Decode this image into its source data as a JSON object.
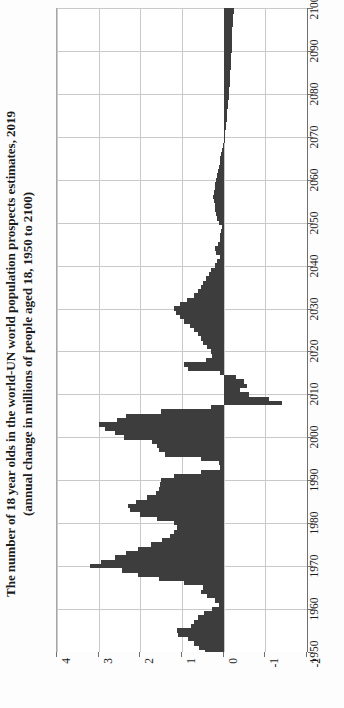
{
  "title": {
    "line1": "The number of 18 year olds in the world-UN world population prospects estimates, 2019",
    "line2": "(annual change in millions of people aged 18, 1950 to 2100)"
  },
  "colors": {
    "bar": "#3d3d3d",
    "grid": "#c9c9c9",
    "axis": "#6f6f6f",
    "background": "#ffffff",
    "text": "#1b1b1b"
  },
  "chart_data": {
    "type": "bar",
    "orientation": "horizontal-rotated",
    "title": "The number of 18 year olds in the world-UN world population prospects estimates, 2019",
    "subtitle": "(annual change in millions of people aged 18, 1950 to 2100)",
    "xlabel": "",
    "ylabel": "annual change in millions of people aged 18",
    "value_axis_ticks": [
      "4",
      "3",
      "2",
      "1",
      "0",
      "-1",
      "-2"
    ],
    "value_axis_tick_values": [
      4,
      3,
      2,
      1,
      0,
      -1,
      -2
    ],
    "value_axis_range": [
      4,
      -2
    ],
    "category_axis_ticks": [
      "1950",
      "1960",
      "1970",
      "1980",
      "1990",
      "2000",
      "2010",
      "2020",
      "2030",
      "2040",
      "2050",
      "2060",
      "2070",
      "2080",
      "2090",
      "2100"
    ],
    "category_axis_range": [
      1950,
      2100
    ],
    "grid": true,
    "legend": "none",
    "x": [
      1950,
      1951,
      1952,
      1953,
      1954,
      1955,
      1956,
      1957,
      1958,
      1959,
      1960,
      1961,
      1962,
      1963,
      1964,
      1965,
      1966,
      1967,
      1968,
      1969,
      1970,
      1971,
      1972,
      1973,
      1974,
      1975,
      1976,
      1977,
      1978,
      1979,
      1980,
      1981,
      1982,
      1983,
      1984,
      1985,
      1986,
      1987,
      1988,
      1989,
      1990,
      1991,
      1992,
      1993,
      1994,
      1995,
      1996,
      1997,
      1998,
      1999,
      2000,
      2001,
      2002,
      2003,
      2004,
      2005,
      2006,
      2007,
      2008,
      2009,
      2010,
      2011,
      2012,
      2013,
      2014,
      2015,
      2016,
      2017,
      2018,
      2019,
      2020,
      2021,
      2022,
      2023,
      2024,
      2025,
      2026,
      2027,
      2028,
      2029,
      2030,
      2031,
      2032,
      2033,
      2034,
      2035,
      2036,
      2037,
      2038,
      2039,
      2040,
      2041,
      2042,
      2043,
      2044,
      2045,
      2046,
      2047,
      2048,
      2049,
      2050,
      2051,
      2052,
      2053,
      2054,
      2055,
      2056,
      2057,
      2058,
      2059,
      2060,
      2061,
      2062,
      2063,
      2064,
      2065,
      2066,
      2067,
      2068,
      2069,
      2070,
      2071,
      2072,
      2073,
      2074,
      2075,
      2076,
      2077,
      2078,
      2079,
      2080,
      2081,
      2082,
      2083,
      2084,
      2085,
      2086,
      2087,
      2088,
      2089,
      2090,
      2091,
      2092,
      2093,
      2094,
      2095,
      2096,
      2097,
      2098,
      2099,
      2100
    ],
    "values": [
      0.45,
      0.6,
      0.72,
      0.85,
      1.1,
      1.12,
      0.78,
      0.72,
      0.62,
      0.48,
      0.28,
      0.12,
      0.2,
      0.4,
      0.55,
      0.5,
      0.95,
      1.55,
      2.05,
      2.45,
      3.2,
      2.95,
      2.6,
      2.35,
      2.05,
      1.75,
      1.48,
      1.3,
      1.2,
      1.12,
      1.2,
      1.6,
      2.0,
      2.25,
      2.3,
      2.1,
      1.85,
      1.62,
      1.55,
      1.52,
      1.5,
      1.2,
      0.55,
      0.1,
      0.12,
      0.55,
      1.4,
      1.55,
      1.6,
      1.72,
      2.4,
      2.6,
      2.85,
      3.0,
      2.55,
      2.35,
      1.5,
      0.3,
      -1.4,
      -1.1,
      -0.62,
      -0.4,
      -0.55,
      -0.5,
      -0.3,
      0.1,
      0.85,
      0.95,
      0.42,
      0.28,
      0.3,
      0.4,
      0.5,
      0.55,
      0.62,
      0.72,
      0.82,
      0.95,
      1.05,
      1.15,
      1.2,
      1.05,
      0.88,
      0.72,
      0.62,
      0.55,
      0.5,
      0.42,
      0.35,
      0.3,
      0.22,
      0.15,
      0.1,
      0.18,
      0.22,
      0.14,
      0.1,
      0.08,
      0.06,
      0.05,
      0.12,
      0.16,
      0.18,
      0.2,
      0.22,
      0.24,
      0.25,
      0.24,
      0.22,
      0.2,
      0.18,
      0.16,
      0.14,
      0.12,
      0.1,
      0.08,
      0.06,
      0.04,
      0.02,
      0.0,
      -0.02,
      -0.04,
      -0.05,
      -0.06,
      -0.07,
      -0.08,
      -0.09,
      -0.1,
      -0.11,
      -0.12,
      -0.13,
      -0.14,
      -0.15,
      -0.15,
      -0.16,
      -0.16,
      -0.17,
      -0.17,
      -0.18,
      -0.18,
      -0.19,
      -0.19,
      -0.2,
      -0.2,
      -0.21,
      -0.21,
      -0.22,
      -0.22,
      -0.23,
      -0.24,
      -0.25
    ]
  }
}
